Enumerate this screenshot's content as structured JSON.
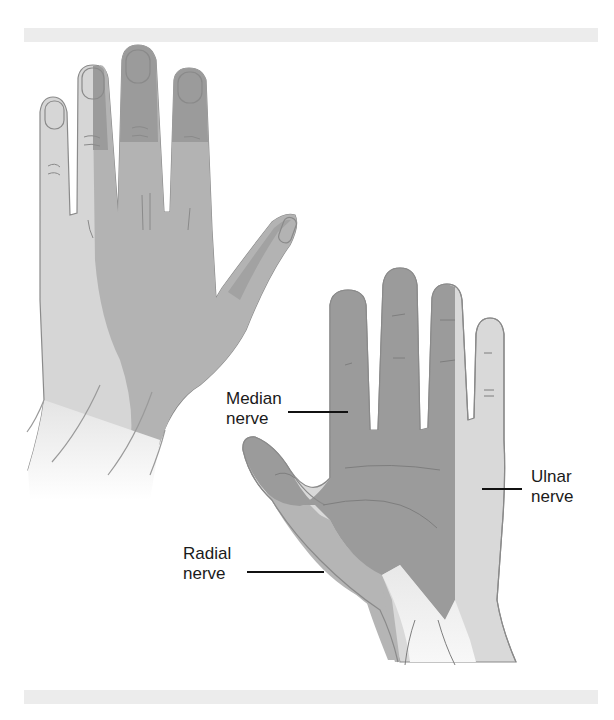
{
  "figure": {
    "views": [
      {
        "id": "dorsal",
        "description": "Back of hand"
      },
      {
        "id": "palmar",
        "description": "Palm of hand"
      }
    ]
  },
  "labels": {
    "median": {
      "line1": "Median",
      "line2": "nerve"
    },
    "ulnar": {
      "line1": "Ulnar",
      "line2": "nerve"
    },
    "radial": {
      "line1": "Radial",
      "line2": "nerve"
    }
  },
  "colors": {
    "median_region": "#9b9b9b",
    "radial_region": "#b4b4b4",
    "ulnar_region": "#d9d9d9",
    "wrist_fade": "#ebebeb",
    "outline": "#8a8a8a",
    "frame_bar": "#ececec",
    "leader_line": "#111111"
  }
}
